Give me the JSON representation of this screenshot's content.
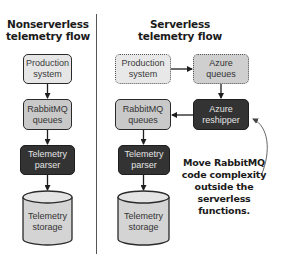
{
  "left_flow": {
    "title": "Nonserverless\ntelemetry flow",
    "nodes": {
      "production": "Production\nsystem",
      "rabbitmq": "RabbitMQ\nqueues",
      "parser": "Telemetry\nparser",
      "storage": "Telemetry\nstorage"
    }
  },
  "right_flow": {
    "title": "Serverless\ntelemetry flow",
    "nodes": {
      "production": "Production\nsystem",
      "azure_queues": "Azure\nqueues",
      "azure_reshipper": "Azure\nreshipper",
      "rabbitmq": "RabbitMQ\nqueues",
      "parser": "Telemetry\nparser",
      "storage": "Telemetry\nstorage"
    },
    "annotation": "Move RabbitMQ\ncode complexity\noutside the serverless\nfunctions."
  },
  "colors": {
    "light_fill": "#e6e6e6",
    "mid_fill": "#c9c9c9",
    "dark_fill": "#333333",
    "line": "#2a2a2a"
  }
}
